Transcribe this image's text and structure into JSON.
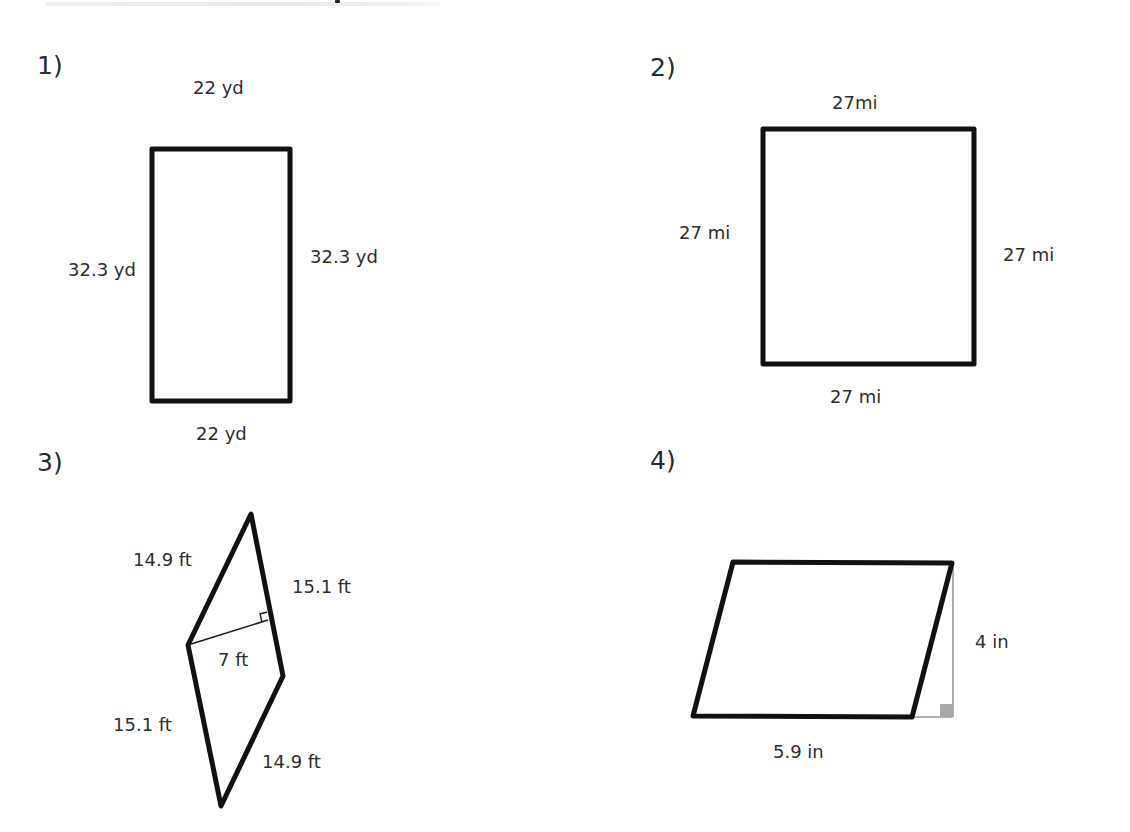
{
  "document": {
    "type": "worksheet",
    "topic": "area of rectangles, squares and parallelograms"
  },
  "colors": {
    "shape_stroke": "#111111",
    "height_line_fig3": "#1a1a1a",
    "height_line_fig4": "#9a9a9a",
    "right_angle_fill_fig4": "#a9a9a9",
    "text": "#2e2e2e"
  },
  "problems": [
    {
      "number": "1)",
      "shape": "rectangle",
      "labels": {
        "top": "22 yd",
        "left": "32.3 yd",
        "right": "32.3 yd",
        "bottom": "22 yd"
      }
    },
    {
      "number": "2)",
      "shape": "square",
      "labels": {
        "top": "27mi",
        "left": "27 mi",
        "right": "27 mi",
        "bottom": "27 mi"
      }
    },
    {
      "number": "3)",
      "shape": "parallelogram",
      "labels": {
        "upper_left": "14.9 ft",
        "upper_right": "15.1 ft",
        "height": "7 ft",
        "lower_left": "15.1 ft",
        "lower_right": "14.9 ft"
      },
      "right_angle_icon": "right-angle-marker"
    },
    {
      "number": "4)",
      "shape": "parallelogram",
      "labels": {
        "height": "4 in",
        "base": "5.9 in"
      },
      "right_angle_icon": "right-angle-marker-filled"
    }
  ]
}
